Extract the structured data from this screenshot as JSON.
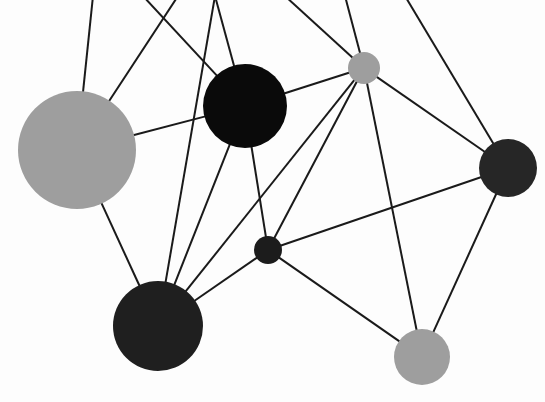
{
  "canvas": {
    "width": 545,
    "height": 402,
    "background_color": "#fdfdfd",
    "title": "Node-link network diagram"
  },
  "style": {
    "edge_color": "#1a1a1a",
    "edge_width": 2,
    "palette": {
      "black": "#0a0a0a",
      "dark": "#1f1f1f",
      "dark_alt": "#262626",
      "gray": "#9e9e9e"
    }
  },
  "chart_data": {
    "type": "scatter",
    "xlabel": "",
    "ylabel": "",
    "grid": false,
    "legend": "none",
    "xlim": [
      0,
      545
    ],
    "ylim": [
      0,
      402
    ],
    "nodes": [
      {
        "id": "n1",
        "label": "large-gray-node",
        "x": 77,
        "y": 150,
        "r": 59,
        "color": "#9e9e9e",
        "degree": 5
      },
      {
        "id": "n2",
        "label": "black-node",
        "x": 245,
        "y": 106,
        "r": 42,
        "color": "#0a0a0a",
        "degree": 6
      },
      {
        "id": "n3",
        "label": "small-gray-node",
        "x": 364,
        "y": 68,
        "r": 16,
        "color": "#9e9e9e",
        "degree": 8
      },
      {
        "id": "n4",
        "label": "right-dark-node",
        "x": 508,
        "y": 168,
        "r": 29,
        "color": "#262626",
        "degree": 5
      },
      {
        "id": "n5",
        "label": "center-small-dark-node",
        "x": 268,
        "y": 250,
        "r": 14,
        "color": "#1c1c1c",
        "degree": 5
      },
      {
        "id": "n6",
        "label": "bottom-left-dark-node",
        "x": 158,
        "y": 326,
        "r": 45,
        "color": "#1f1f1f",
        "degree": 5
      },
      {
        "id": "n7",
        "label": "bottom-right-gray-node",
        "x": 422,
        "y": 357,
        "r": 28,
        "color": "#9e9e9e",
        "degree": 4
      }
    ],
    "boundary_stubs": [
      {
        "id": "b1",
        "x": 93,
        "y": -4
      },
      {
        "id": "b2",
        "x": 143,
        "y": -4
      },
      {
        "id": "b3",
        "x": 178,
        "y": -4
      },
      {
        "id": "b4",
        "x": 215,
        "y": -4
      },
      {
        "id": "b5",
        "x": 285,
        "y": -4
      },
      {
        "id": "b6",
        "x": 345,
        "y": -4
      },
      {
        "id": "b7",
        "x": 405,
        "y": -4
      }
    ],
    "edges": [
      {
        "source": "n1",
        "target": "n2"
      },
      {
        "source": "n1",
        "target": "n6"
      },
      {
        "source": "n1",
        "target": "b1"
      },
      {
        "source": "n1",
        "target": "b3"
      },
      {
        "source": "n2",
        "target": "n3"
      },
      {
        "source": "n2",
        "target": "n5"
      },
      {
        "source": "n2",
        "target": "n6"
      },
      {
        "source": "n2",
        "target": "b2"
      },
      {
        "source": "n2",
        "target": "b4"
      },
      {
        "source": "n3",
        "target": "n4"
      },
      {
        "source": "n3",
        "target": "n5"
      },
      {
        "source": "n3",
        "target": "n6"
      },
      {
        "source": "n3",
        "target": "n7"
      },
      {
        "source": "n3",
        "target": "b5"
      },
      {
        "source": "n3",
        "target": "b6"
      },
      {
        "source": "n4",
        "target": "n5"
      },
      {
        "source": "n4",
        "target": "n7"
      },
      {
        "source": "n4",
        "target": "b7"
      },
      {
        "source": "n5",
        "target": "n6"
      },
      {
        "source": "n5",
        "target": "n7"
      },
      {
        "source": "n6",
        "target": "b4"
      }
    ]
  }
}
